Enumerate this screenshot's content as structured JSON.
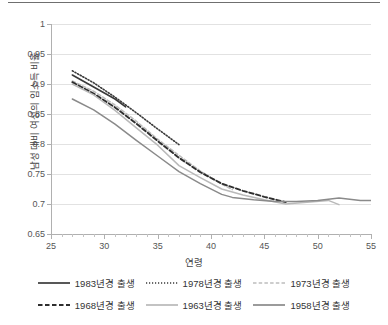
{
  "chart_data": {
    "type": "line",
    "title": "",
    "xlabel": "연령",
    "ylabel": "남성 대비 여성의 임소득 비율",
    "xlim": [
      25,
      55
    ],
    "ylim": [
      0.65,
      1
    ],
    "xticks": [
      25,
      30,
      35,
      40,
      45,
      50,
      55
    ],
    "xtick_labels": [
      "25",
      "30",
      "35",
      "40",
      "45",
      "50",
      "55"
    ],
    "xtick_minor_step": 1,
    "yticks": [
      0.65,
      0.7,
      0.75,
      0.8,
      0.85,
      0.9,
      0.95,
      1
    ],
    "ytick_labels": [
      "0.65",
      "0.7",
      "0.75",
      "0.8",
      "0.85",
      "0.9",
      "0.95",
      "1"
    ],
    "grid": "horizontal",
    "legend_position": "bottom",
    "series": [
      {
        "name": "1983년경 출생",
        "style": "solid",
        "color": "#3a3a3a",
        "width": 1.6,
        "x": [
          27,
          28,
          29,
          30,
          31,
          32
        ],
        "values": [
          0.915,
          0.905,
          0.895,
          0.885,
          0.875,
          0.862
        ]
      },
      {
        "name": "1978년경 출생",
        "style": "dotted",
        "color": "#3a3a3a",
        "width": 1.6,
        "x": [
          27,
          29,
          31,
          33,
          35,
          37
        ],
        "values": [
          0.922,
          0.902,
          0.878,
          0.852,
          0.825,
          0.799
        ]
      },
      {
        "name": "1973년경 출생",
        "style": "dash-light",
        "color": "#bdbdbd",
        "width": 1.5,
        "x": [
          27,
          29,
          31,
          33,
          35,
          37,
          39,
          41,
          42
        ],
        "values": [
          0.905,
          0.888,
          0.865,
          0.838,
          0.808,
          0.781,
          0.755,
          0.733,
          0.724
        ]
      },
      {
        "name": "1968년경 출생",
        "style": "dashed",
        "color": "#2e2e2e",
        "width": 1.9,
        "x": [
          27,
          29,
          31,
          33,
          35,
          37,
          39,
          41,
          43,
          45,
          47
        ],
        "values": [
          0.903,
          0.884,
          0.861,
          0.834,
          0.805,
          0.777,
          0.753,
          0.734,
          0.722,
          0.712,
          0.703
        ]
      },
      {
        "name": "1963년경 출생",
        "style": "solid",
        "color": "#b9b9b9",
        "width": 1.5,
        "x": [
          27,
          29,
          31,
          33,
          35,
          37,
          39,
          41,
          43,
          45,
          47,
          49,
          51,
          52
        ],
        "values": [
          0.9,
          0.882,
          0.856,
          0.827,
          0.798,
          0.764,
          0.744,
          0.725,
          0.715,
          0.707,
          0.7,
          0.703,
          0.706,
          0.699
        ]
      },
      {
        "name": "1958년경 출생",
        "style": "solid",
        "color": "#8a8a8a",
        "width": 1.5,
        "x": [
          27,
          29,
          31,
          33,
          35,
          37,
          39,
          41,
          42,
          44,
          46,
          48,
          50,
          52,
          54,
          55
        ],
        "values": [
          0.875,
          0.857,
          0.833,
          0.806,
          0.78,
          0.754,
          0.734,
          0.716,
          0.711,
          0.707,
          0.704,
          0.704,
          0.706,
          0.71,
          0.706,
          0.706
        ]
      }
    ]
  },
  "legend": {
    "rows": [
      [
        {
          "label": "1983년경 출생",
          "style": "solid",
          "color": "#3a3a3a"
        },
        {
          "label": "1978년경 출생",
          "style": "dotted",
          "color": "#3a3a3a"
        },
        {
          "label": "1973년경 출생",
          "style": "dash-light",
          "color": "#bdbdbd"
        }
      ],
      [
        {
          "label": "1968년경 출생",
          "style": "dashed",
          "color": "#2e2e2e"
        },
        {
          "label": "1963년경 출생",
          "style": "solid",
          "color": "#b9b9b9"
        },
        {
          "label": "1958년경 출생",
          "style": "solid",
          "color": "#8a8a8a"
        }
      ]
    ]
  }
}
